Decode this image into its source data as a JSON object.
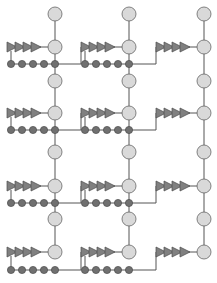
{
  "diagram": {
    "type": "grid-graph",
    "width": 217,
    "height": 283,
    "colors": {
      "edge": "#555555",
      "node_fill": "#d9d9d9",
      "node_stroke": "#666666",
      "small_dot_fill": "#707070",
      "small_dot_stroke": "#4a4a4a",
      "arrow_fill": "#808080",
      "arrow_stroke": "#4a4a4a"
    },
    "columns_x": [
      55,
      129,
      204
    ],
    "rows": [
      {
        "top_node_y": 14,
        "main_node_y": 47,
        "dots_y": 64
      },
      {
        "top_node_y": 81,
        "main_node_y": 113,
        "dots_y": 130
      },
      {
        "top_node_y": 152,
        "main_node_y": 186,
        "dots_y": 203
      },
      {
        "top_node_y": 219,
        "main_node_y": 252,
        "dots_y": 270
      }
    ],
    "node_radius": 7,
    "dot_radius": 3.6,
    "arrow_count": 4,
    "dot_count": 5
  }
}
